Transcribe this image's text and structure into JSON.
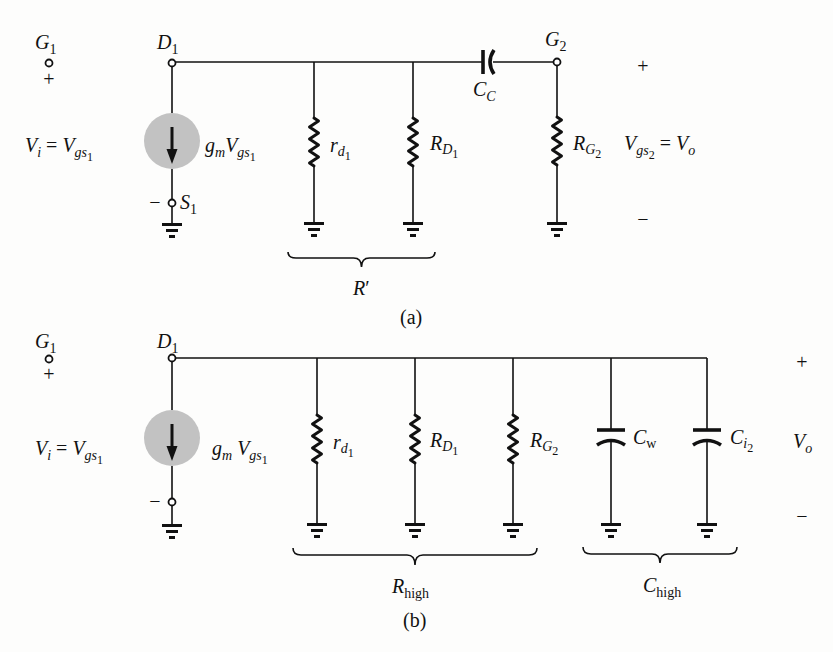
{
  "figure": {
    "colors": {
      "ink": "#111111",
      "source_fill": "#c2c2c2",
      "background": "#fdfdfc"
    },
    "panel_a": {
      "caption": "(a)",
      "g1": {
        "base": "G",
        "sub": "1",
        "polarity": "+"
      },
      "d1": {
        "base": "D",
        "sub": "1"
      },
      "input_voltage": {
        "lhs": "V",
        "lhs_sub": "i",
        "eq": " = ",
        "rhs": "V",
        "rhs_sub": "gs",
        "rhs_subsub": "1"
      },
      "current_source": {
        "g": "g",
        "g_sub": "m",
        "v": "V",
        "v_sub": "gs",
        "v_subsub": "1"
      },
      "s1": {
        "polarity": "−",
        "base": "S",
        "sub": "1"
      },
      "r_d1": {
        "base": "r",
        "sub": "d",
        "subsub": "1"
      },
      "r_D1": {
        "base": "R",
        "sub": "D",
        "subsub": "1"
      },
      "c_c": {
        "base": "C",
        "sub": "C"
      },
      "g2": {
        "base": "G",
        "sub": "2"
      },
      "r_G2": {
        "base": "R",
        "sub": "G",
        "subsub": "2"
      },
      "output_voltage": {
        "lhs": "V",
        "lhs_sub": "gs",
        "lhs_subsub": "2",
        "eq": " = ",
        "rhs": "V",
        "rhs_sub": "o",
        "plus": "+",
        "minus": "−"
      },
      "brace": {
        "base": "R",
        "prime": "′"
      }
    },
    "panel_b": {
      "caption": "(b)",
      "g1": {
        "base": "G",
        "sub": "1",
        "polarity": "+"
      },
      "d1": {
        "base": "D",
        "sub": "1"
      },
      "input_voltage": {
        "lhs": "V",
        "lhs_sub": "i",
        "eq": " = ",
        "rhs": "V",
        "rhs_sub": "gs",
        "rhs_subsub": "1"
      },
      "current_source": {
        "g": "g",
        "g_sub": "m",
        "v": " V",
        "v_sub": "gs",
        "v_subsub": "1"
      },
      "source_terminal": {
        "polarity": "−"
      },
      "r_d1": {
        "base": "r",
        "sub": "d",
        "subsub": "1"
      },
      "r_D1": {
        "base": "R",
        "sub": "D",
        "subsub": "1"
      },
      "r_G2": {
        "base": "R",
        "sub": "G",
        "subsub": "2"
      },
      "c_w": {
        "base": "C",
        "sub": "w"
      },
      "c_i2": {
        "base": "C",
        "sub": "i",
        "subsub": "2"
      },
      "output_voltage": {
        "base": "V",
        "sub": "o",
        "plus": "+",
        "minus": "−"
      },
      "resistance_brace": {
        "base": "R",
        "sub": "high"
      },
      "capacitance_brace": {
        "base": "C",
        "sub": "high"
      }
    }
  }
}
